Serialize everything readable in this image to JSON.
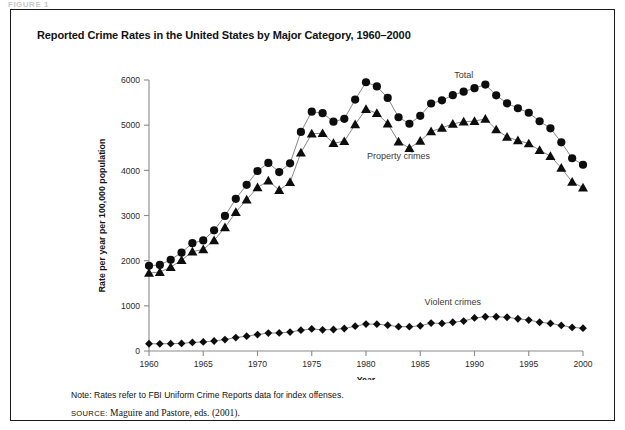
{
  "figure": {
    "tag": "FIGURE 1",
    "title": "Reported Crime Rates in the United States by Major Category, 1960–2000",
    "note": "Note: Rates refer to FBI Uniform Crime Reports data for index offenses.",
    "source_label": "SOURCE:",
    "source_text": "Maguire and Pastore, eds. (2001)."
  },
  "colors": {
    "marker": "#0d0d0d",
    "line": "#555555",
    "axis": "#8a8a8a",
    "frame": "#1a1a1a",
    "text": "#111111",
    "label_text": "#3a3a3a"
  },
  "chart_data": {
    "type": "line",
    "title": "Reported Crime Rates in the United States by Major Category, 1960–2000",
    "subtitle": "",
    "xlabel": "Year",
    "ylabel": "Rate per year per 100,000 population",
    "xlim": [
      1960,
      2000
    ],
    "ylim": [
      0,
      6000
    ],
    "xticks": [
      1960,
      1965,
      1970,
      1975,
      1980,
      1985,
      1990,
      1995,
      2000
    ],
    "yticks": [
      0,
      1000,
      2000,
      3000,
      4000,
      5000,
      6000
    ],
    "xtick_labels": [
      "1960",
      "1965",
      "1970",
      "1975",
      "1980",
      "1985",
      "1990",
      "1995",
      "2000"
    ],
    "ytick_labels": [
      "0",
      "1000",
      "2000",
      "3000",
      "4000",
      "5000",
      "6000"
    ],
    "grid": false,
    "legend": "inline-annotations",
    "x": [
      1960,
      1961,
      1962,
      1963,
      1964,
      1965,
      1966,
      1967,
      1968,
      1969,
      1970,
      1971,
      1972,
      1973,
      1974,
      1975,
      1976,
      1977,
      1978,
      1979,
      1980,
      1981,
      1982,
      1983,
      1984,
      1985,
      1986,
      1987,
      1988,
      1989,
      1990,
      1991,
      1992,
      1993,
      1994,
      1995,
      1996,
      1997,
      1998,
      1999,
      2000
    ],
    "series": [
      {
        "name": "Total",
        "marker": "circle",
        "label_position": "above-right",
        "values": [
          1887,
          1906,
          2020,
          2180,
          2388,
          2449,
          2671,
          2990,
          3370,
          3680,
          3985,
          4165,
          3961,
          4155,
          4850,
          5299,
          5266,
          5078,
          5140,
          5566,
          5950,
          5858,
          5604,
          5175,
          5031,
          5207,
          5480,
          5550,
          5664,
          5741,
          5820,
          5898,
          5660,
          5484,
          5374,
          5275,
          5087,
          4930,
          4620,
          4267,
          4124
        ]
      },
      {
        "name": "Property crimes",
        "marker": "triangle",
        "label_position": "below",
        "values": [
          1726,
          1747,
          1857,
          2012,
          2198,
          2249,
          2450,
          2736,
          3072,
          3351,
          3621,
          3769,
          3561,
          3737,
          4389,
          4811,
          4820,
          4602,
          4643,
          5017,
          5353,
          5264,
          5033,
          4637,
          4492,
          4651,
          4863,
          4940,
          5027,
          5078,
          5089,
          5140,
          4903,
          4740,
          4660,
          4593,
          4445,
          4316,
          4053,
          3744,
          3618
        ]
      },
      {
        "name": "Violent crimes",
        "marker": "diamond",
        "label_position": "above",
        "values": [
          161,
          159,
          163,
          168,
          190,
          200,
          221,
          254,
          298,
          329,
          364,
          396,
          401,
          418,
          461,
          488,
          468,
          476,
          498,
          549,
          597,
          594,
          571,
          538,
          539,
          557,
          618,
          610,
          637,
          663,
          732,
          758,
          758,
          747,
          714,
          685,
          637,
          611,
          567,
          523,
          506
        ]
      }
    ],
    "annotations": [
      {
        "text": "Total",
        "x": 1989,
        "y": 6050
      },
      {
        "text": "Property crimes",
        "x": 1983,
        "y": 4250
      },
      {
        "text": "Violent crimes",
        "x": 1988,
        "y": 1020
      }
    ]
  }
}
